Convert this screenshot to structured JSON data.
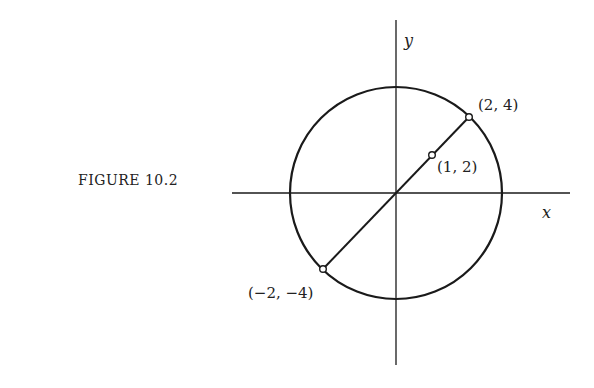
{
  "caption": "FIGURE 10.2",
  "axes": {
    "x_label": "x",
    "y_label": "y"
  },
  "points": [
    {
      "label": "(2, 4)",
      "x": 2,
      "y": 4
    },
    {
      "label": "(1, 2)",
      "x": 1,
      "y": 2
    },
    {
      "label": "(−2, −4)",
      "x": -2,
      "y": -4
    }
  ],
  "circle": {
    "center": [
      0,
      0
    ],
    "radius_squared": 20
  },
  "colors": {
    "stroke": "#1a1a1a",
    "background": "#ffffff"
  }
}
